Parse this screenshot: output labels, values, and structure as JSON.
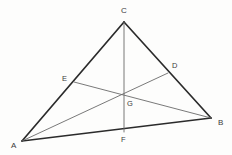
{
  "figure": {
    "type": "geometry-diagram",
    "background_color": "#fdfdfc",
    "canvas": {
      "width": 232,
      "height": 155
    },
    "styles": {
      "side_color": "#2b2b2b",
      "side_width": 1.7,
      "cevian_color": "#6a6a6a",
      "cevian_width": 0.9,
      "label_color": "#3b3b3b"
    },
    "points": [
      {
        "id": "A",
        "label": "A",
        "x": 22,
        "y": 141,
        "label_x": 11,
        "label_y": 142,
        "kind": "vertex"
      },
      {
        "id": "B",
        "label": "B",
        "x": 211,
        "y": 118,
        "label_x": 218,
        "label_y": 119,
        "kind": "vertex"
      },
      {
        "id": "C",
        "label": "C",
        "x": 124,
        "y": 22,
        "label_x": 121,
        "label_y": 7,
        "kind": "vertex"
      },
      {
        "id": "D",
        "label": "D",
        "x": 168,
        "y": 73,
        "label_x": 172,
        "label_y": 62,
        "kind": "midpoint"
      },
      {
        "id": "E",
        "label": "E",
        "x": 74,
        "y": 82,
        "label_x": 62,
        "label_y": 75,
        "kind": "midpoint"
      },
      {
        "id": "F",
        "label": "F",
        "x": 124,
        "y": 132,
        "label_x": 121,
        "label_y": 136,
        "kind": "midpoint"
      },
      {
        "id": "G",
        "label": "G",
        "x": 124,
        "y": 97,
        "label_x": 127,
        "label_y": 100,
        "kind": "intersection"
      }
    ],
    "sides": [
      {
        "id": "AC",
        "from": "A",
        "to": "C"
      },
      {
        "id": "CB",
        "from": "C",
        "to": "B"
      },
      {
        "id": "AB",
        "from": "A",
        "to": "B"
      }
    ],
    "cevians": [
      {
        "id": "CF",
        "from": "C",
        "to": "F"
      },
      {
        "id": "AD",
        "from": "A",
        "to": "D"
      },
      {
        "id": "BE",
        "from": "B",
        "to": "E"
      }
    ]
  }
}
